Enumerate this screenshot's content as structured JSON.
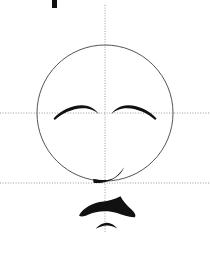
{
  "figure": {
    "background_color": "#ffffff",
    "canvas": {
      "width": 210,
      "height": 253
    }
  },
  "colors": {
    "stroke_dark": "#111111",
    "guide_line": "#9a9a9a",
    "circle_outline": "#555555",
    "background": "#ffffff"
  },
  "guides": {
    "vertical_center_line": {
      "label": "vertical center guideline",
      "style": "dotted",
      "x": 105,
      "y_start": 5,
      "y_end": 232
    },
    "horizontal_eye_line": {
      "label": "eye level guideline",
      "style": "dotted",
      "y": 113,
      "x_start": 0,
      "x_end": 210
    },
    "horizontal_chin_line": {
      "label": "chin level guideline",
      "style": "dotted",
      "y": 183,
      "x_start": 0,
      "x_end": 210
    }
  },
  "head": {
    "label": "head outline circle",
    "center_x": 105,
    "center_y": 113,
    "radius": 68,
    "stroke_width": 1
  },
  "features": {
    "left_eye": {
      "label": "left closed eye arc"
    },
    "right_eye": {
      "label": "right closed eye arc"
    },
    "mouth": {
      "label": "mouth curve stroke"
    },
    "lower_shape": {
      "label": "dark bow-tie shape below chin"
    },
    "lower_arc": {
      "label": "small arc below bow-tie shape"
    },
    "top_mark": {
      "label": "cropped mark at top of image"
    }
  }
}
